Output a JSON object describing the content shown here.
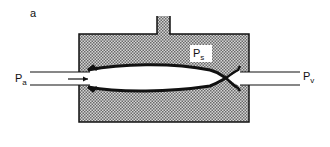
{
  "figure": {
    "panel_label": "a",
    "labels": {
      "inlet_pressure": "P",
      "inlet_sub": "a",
      "chamber_pressure": "P",
      "chamber_sub": "s",
      "outlet_pressure": "P",
      "outlet_sub": "v"
    },
    "colors": {
      "stroke": "#111111",
      "fill_pattern_dark": "#6e6e6e",
      "fill_pattern_light": "#d0d0d0",
      "background": "#ffffff"
    }
  }
}
